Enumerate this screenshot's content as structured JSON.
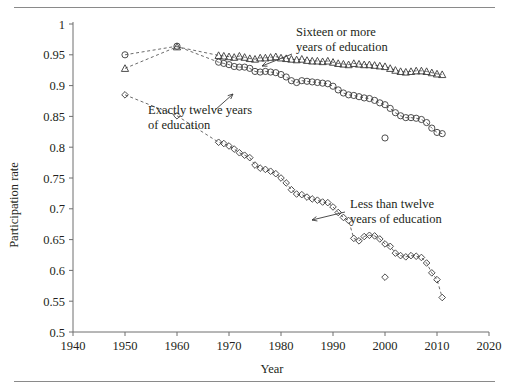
{
  "figure": {
    "axis": {
      "xlabel": "Year",
      "ylabel": "Participation rate",
      "x_ticks": [
        "1940",
        "1950",
        "1960",
        "1970",
        "1980",
        "1990",
        "2000",
        "2010",
        "2020"
      ],
      "y_ticks": [
        "0.5",
        "0.55",
        "0.6",
        "0.65",
        "0.7",
        "0.75",
        "0.8",
        "0.85",
        "0.9",
        "0.95",
        "1"
      ]
    },
    "annotations": {
      "sixteen_line1": "Sixteen or more",
      "sixteen_line2": "years of education",
      "twelve_line1": "Exactly twelve years",
      "twelve_line2": "of education",
      "less_line1": "Less than twelve",
      "less_line2": "years of education"
    }
  },
  "chart_data": {
    "type": "line",
    "title": "",
    "xlabel": "Year",
    "ylabel": "Participation rate",
    "xlim": [
      1940,
      2020
    ],
    "ylim": [
      0.5,
      1.0
    ],
    "xticks": [
      1940,
      1950,
      1960,
      1970,
      1980,
      1990,
      2000,
      2010,
      2020
    ],
    "yticks": [
      0.5,
      0.55,
      0.6,
      0.65,
      0.7,
      0.75,
      0.8,
      0.85,
      0.9,
      0.95,
      1.0
    ],
    "grid": false,
    "legend": "annotations-inline",
    "series": [
      {
        "name": "Sixteen or more years of education",
        "marker": "triangle",
        "linestyle": "dashed",
        "points": [
          [
            1950,
            0.928
          ],
          [
            1960,
            0.963
          ],
          [
            1968,
            0.949
          ],
          [
            1969,
            0.948
          ],
          [
            1970,
            0.947
          ],
          [
            1971,
            0.946
          ],
          [
            1972,
            0.948
          ],
          [
            1973,
            0.946
          ],
          [
            1974,
            0.944
          ],
          [
            1975,
            0.943
          ],
          [
            1976,
            0.945
          ],
          [
            1977,
            0.945
          ],
          [
            1978,
            0.946
          ],
          [
            1979,
            0.947
          ],
          [
            1980,
            0.945
          ],
          [
            1981,
            0.944
          ],
          [
            1982,
            0.943
          ],
          [
            1983,
            0.942
          ],
          [
            1984,
            0.943
          ],
          [
            1985,
            0.941
          ],
          [
            1986,
            0.94
          ],
          [
            1987,
            0.94
          ],
          [
            1988,
            0.939
          ],
          [
            1989,
            0.94
          ],
          [
            1990,
            0.938
          ],
          [
            1991,
            0.936
          ],
          [
            1992,
            0.935
          ],
          [
            1993,
            0.934
          ],
          [
            1994,
            0.936
          ],
          [
            1995,
            0.935
          ],
          [
            1996,
            0.934
          ],
          [
            1997,
            0.934
          ],
          [
            1998,
            0.933
          ],
          [
            1999,
            0.932
          ],
          [
            2000,
            0.931
          ],
          [
            2001,
            0.928
          ],
          [
            2002,
            0.925
          ],
          [
            2003,
            0.923
          ],
          [
            2004,
            0.922
          ],
          [
            2005,
            0.923
          ],
          [
            2006,
            0.924
          ],
          [
            2007,
            0.924
          ],
          [
            2008,
            0.923
          ],
          [
            2009,
            0.921
          ],
          [
            2010,
            0.919
          ],
          [
            2011,
            0.918
          ]
        ]
      },
      {
        "name": "Exactly twelve years of education",
        "marker": "circle",
        "linestyle": "dashed",
        "points": [
          [
            1950,
            0.95
          ],
          [
            1960,
            0.964
          ],
          [
            1968,
            0.938
          ],
          [
            1969,
            0.936
          ],
          [
            1970,
            0.934
          ],
          [
            1971,
            0.931
          ],
          [
            1972,
            0.93
          ],
          [
            1973,
            0.93
          ],
          [
            1974,
            0.928
          ],
          [
            1975,
            0.923
          ],
          [
            1976,
            0.922
          ],
          [
            1977,
            0.923
          ],
          [
            1978,
            0.922
          ],
          [
            1979,
            0.921
          ],
          [
            1980,
            0.918
          ],
          [
            1981,
            0.914
          ],
          [
            1982,
            0.908
          ],
          [
            1983,
            0.905
          ],
          [
            1984,
            0.908
          ],
          [
            1985,
            0.907
          ],
          [
            1986,
            0.906
          ],
          [
            1987,
            0.905
          ],
          [
            1988,
            0.904
          ],
          [
            1989,
            0.903
          ],
          [
            1990,
            0.899
          ],
          [
            1991,
            0.893
          ],
          [
            1992,
            0.888
          ],
          [
            1993,
            0.885
          ],
          [
            1994,
            0.884
          ],
          [
            1995,
            0.882
          ],
          [
            1996,
            0.88
          ],
          [
            1997,
            0.879
          ],
          [
            1998,
            0.876
          ],
          [
            1999,
            0.872
          ],
          [
            2000,
            0.869
          ],
          [
            2001,
            0.863
          ],
          [
            2002,
            0.856
          ],
          [
            2003,
            0.851
          ],
          [
            2004,
            0.848
          ],
          [
            2005,
            0.848
          ],
          [
            2006,
            0.847
          ],
          [
            2007,
            0.845
          ],
          [
            2008,
            0.84
          ],
          [
            2009,
            0.831
          ],
          [
            2010,
            0.824
          ],
          [
            2011,
            0.822
          ]
        ],
        "outlier_points": [
          [
            2000,
            0.815
          ]
        ]
      },
      {
        "name": "Less than twelve years of education",
        "marker": "diamond",
        "linestyle": "dashed",
        "points": [
          [
            1950,
            0.885
          ],
          [
            1960,
            0.851
          ],
          [
            1968,
            0.808
          ],
          [
            1969,
            0.806
          ],
          [
            1970,
            0.802
          ],
          [
            1971,
            0.797
          ],
          [
            1972,
            0.791
          ],
          [
            1973,
            0.787
          ],
          [
            1974,
            0.783
          ],
          [
            1975,
            0.771
          ],
          [
            1976,
            0.766
          ],
          [
            1977,
            0.764
          ],
          [
            1978,
            0.761
          ],
          [
            1979,
            0.757
          ],
          [
            1980,
            0.75
          ],
          [
            1981,
            0.742
          ],
          [
            1982,
            0.731
          ],
          [
            1983,
            0.724
          ],
          [
            1984,
            0.723
          ],
          [
            1985,
            0.719
          ],
          [
            1986,
            0.716
          ],
          [
            1987,
            0.714
          ],
          [
            1988,
            0.711
          ],
          [
            1989,
            0.71
          ],
          [
            1990,
            0.703
          ],
          [
            1991,
            0.694
          ],
          [
            1992,
            0.686
          ],
          [
            1993,
            0.681
          ],
          [
            1994,
            0.652
          ],
          [
            1995,
            0.648
          ],
          [
            1996,
            0.655
          ],
          [
            1997,
            0.657
          ],
          [
            1998,
            0.656
          ],
          [
            1999,
            0.651
          ],
          [
            2000,
            0.643
          ],
          [
            2001,
            0.639
          ],
          [
            2002,
            0.628
          ],
          [
            2003,
            0.624
          ],
          [
            2004,
            0.622
          ],
          [
            2005,
            0.624
          ],
          [
            2006,
            0.623
          ],
          [
            2007,
            0.621
          ],
          [
            2008,
            0.612
          ],
          [
            2009,
            0.596
          ],
          [
            2010,
            0.585
          ],
          [
            2011,
            0.556
          ]
        ],
        "outlier_points": [
          [
            2000,
            0.589
          ]
        ]
      }
    ]
  }
}
